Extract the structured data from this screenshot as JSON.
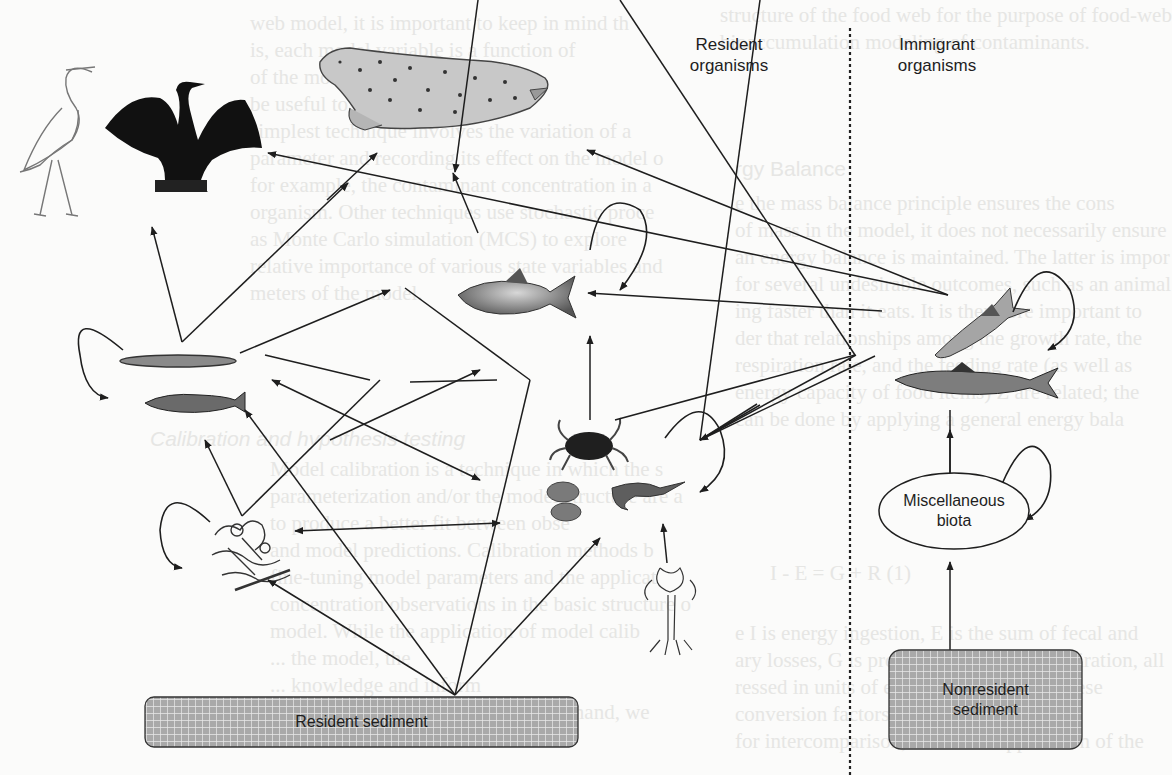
{
  "figure": {
    "column_headers": {
      "resident": "Resident\norganisms",
      "immigrant": "Immigrant\norganisms"
    },
    "nodes": {
      "resident_sediment": {
        "label": "Resident sediment"
      },
      "nonresident_sediment": {
        "label": "Nonresident\nsediment"
      },
      "misc_biota": {
        "label": "Miscellaneous\nbiota"
      }
    },
    "organisms": [
      {
        "id": "heron",
        "icon": "heron-icon",
        "group": "resident"
      },
      {
        "id": "cormorant",
        "icon": "cormorant-icon",
        "group": "resident"
      },
      {
        "id": "seal",
        "icon": "seal-icon",
        "group": "resident"
      },
      {
        "id": "forage-fish",
        "icon": "forage-fish-icon",
        "group": "resident"
      },
      {
        "id": "small-fish",
        "icon": "small-fish-icon",
        "group": "resident"
      },
      {
        "id": "predatory-fish",
        "icon": "predatory-fish-icon",
        "group": "resident"
      },
      {
        "id": "crab",
        "icon": "crab-icon",
        "group": "resident"
      },
      {
        "id": "bivalves",
        "icon": "bivalve-icon",
        "group": "resident"
      },
      {
        "id": "shrimp",
        "icon": "shrimp-icon",
        "group": "resident"
      },
      {
        "id": "benthic-invertebrates",
        "icon": "polychaete-icon",
        "group": "resident"
      },
      {
        "id": "aquatic-plant",
        "icon": "plant-icon",
        "group": "resident"
      },
      {
        "id": "salmon-1",
        "icon": "salmon-icon",
        "group": "immigrant"
      },
      {
        "id": "salmon-2",
        "icon": "salmon-icon",
        "group": "immigrant"
      }
    ],
    "colors": {
      "ink": "#1e1e1e",
      "sediment_fill": "#a9a9a9",
      "grid_line": "#e9e9e9",
      "background": "#fbfbfa"
    }
  },
  "background_text": {
    "left_col": [
      "web model, it is important to keep in mind th",
      "is, each model variable is a function of",
      "of the model ... it is m",
      "be useful to co... analysis",
      "simplest technique involves the variation of a",
      "parameter and recording its effect on the model o",
      "for example, the contaminant concentration in a",
      "organism. Other techniques use stochastic proce",
      "as Monte Carlo simulation (MCS) to explore",
      "relative importance of various state variables and",
      "meters of the model."
    ],
    "calibration_heading": "Calibration and hypothesis testing",
    "calibration_lines": [
      "Model calibration is a technique in which the s",
      "parameterization and/or the model structure are a",
      "to produce a better fit between obse",
      "and model predictions. Calibration methods b",
      "fine-tuning model parameters and the applicat",
      "concentration observations in the basic structure o",
      "model. While the application of model calib",
      "... the model, the",
      "... knowledge and inform",
      "about the contamination problem at hand, we"
    ],
    "right_top": [
      "structure of the food web for the purpose of food-web",
      "bioaccumulation modeling of contaminants."
    ],
    "energy_heading": "rgy Balance",
    "right_mid": [
      "e the mass balance principle ensures the cons",
      "of mass in the model, it does not necessarily ensure",
      "an energy balance is maintained. The latter is impor",
      "for several undesirable outcomes, such as an animal",
      "ing faster than it eats. It is therefore important to",
      "der that relationships among the growth rate, the",
      "respiration rate, and the feeding rate (as well as",
      "energy capacity of food items) Z are related; the",
      "can be done by applying a general energy bala"
    ],
    "equation": "I - E = G + R          (1)",
    "right_bottom": [
      "e I is energy ingestion, E is the sum of fecal and",
      "ary losses, G is production, and R is respiration, all",
      "ressed in units of energy flux (J/day). These",
      "conversion factors (J/day /g) ...",
      "for intercomparison, hence the application of the"
    ]
  }
}
